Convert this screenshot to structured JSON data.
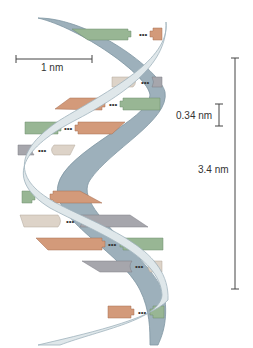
{
  "diagram": {
    "colors": {
      "backbone_front": "#dfe7ea",
      "backbone_front_edge": "#9fb3bd",
      "backbone_back": "#9db0bb",
      "backbone_back_edge": "#7f96a2",
      "base_green": "#98b694",
      "base_orange": "#d39a7a",
      "base_gray": "#a6a6ac",
      "base_beige": "#ddd3c8",
      "scale_line": "#444444"
    },
    "scale_bars": {
      "width_label": "1 nm",
      "rise_label": "0.34 nm",
      "pitch_label": "3.4 nm"
    },
    "base_pairs": [
      {
        "left": "green",
        "right": "orange",
        "y": 34
      },
      {
        "left": "beige",
        "right": "gray",
        "y": 82
      },
      {
        "left": "orange",
        "right": "green",
        "y": 104
      },
      {
        "left": "green",
        "right": "orange",
        "y": 128
      },
      {
        "left": "gray",
        "right": "beige",
        "y": 150
      },
      {
        "left": "green",
        "right": "orange",
        "y": 197
      },
      {
        "left": "beige",
        "right": "gray",
        "y": 221
      },
      {
        "left": "orange",
        "right": "green",
        "y": 244
      },
      {
        "left": "gray",
        "right": "beige",
        "y": 266
      },
      {
        "left": "orange",
        "right": "green",
        "y": 312
      }
    ],
    "hydrogen_bond_symbol": "•••"
  }
}
